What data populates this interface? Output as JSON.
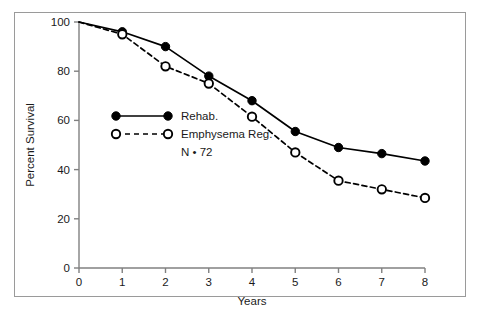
{
  "chart_data": {
    "type": "line",
    "title": "",
    "xlabel": "Years",
    "ylabel": "Percent Survival",
    "x": [
      0,
      1,
      2,
      3,
      4,
      5,
      6,
      7,
      8
    ],
    "xlim": [
      0,
      8
    ],
    "ylim": [
      0,
      100
    ],
    "xticks": [
      "0",
      "1",
      "2",
      "3",
      "4",
      "5",
      "6",
      "7",
      "8"
    ],
    "yticks": [
      "0",
      "20",
      "40",
      "60",
      "80",
      "100"
    ],
    "grid": false,
    "legend_position": "center-left",
    "series": [
      {
        "name": "Rehab.",
        "values": [
          100,
          96,
          90,
          78,
          68,
          55.5,
          49,
          46.5,
          43.5
        ],
        "marker": "filled-circle",
        "linestyle": "solid",
        "color": "#000000"
      },
      {
        "name": "Emphysema Reg.",
        "values": [
          100,
          95,
          82,
          75,
          61.5,
          47,
          35.5,
          32,
          28.5
        ],
        "marker": "open-circle",
        "linestyle": "dashed",
        "color": "#000000"
      }
    ],
    "annotations": [
      "N • 72"
    ]
  },
  "legend": {
    "entries": [
      {
        "label": "Rehab."
      },
      {
        "label": "Emphysema Reg."
      }
    ],
    "note": "N • 72"
  },
  "axes": {
    "x_title": "Years",
    "y_title": "Percent Survival",
    "x_tick_labels": [
      "0",
      "1",
      "2",
      "3",
      "4",
      "5",
      "6",
      "7",
      "8"
    ],
    "y_tick_labels": [
      "0",
      "20",
      "40",
      "60",
      "80",
      "100"
    ]
  },
  "colors": {
    "line": "#000000",
    "axis": "#808080",
    "frame": "#9a9a9a",
    "text": "#1a1a1a",
    "background": "#ffffff"
  }
}
